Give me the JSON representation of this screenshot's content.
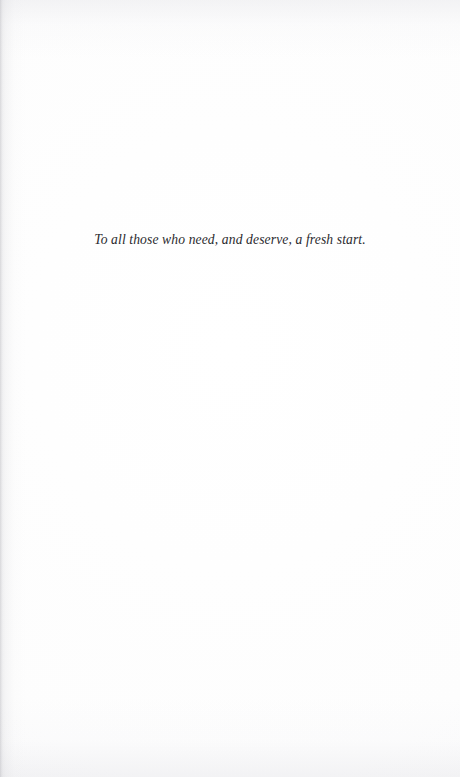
{
  "page": {
    "kind": "book-dedication-page",
    "background_color": "#fefefe",
    "ink_color": "#2a2a2e"
  },
  "dedication": {
    "text": "To all those who need, and deserve, a fresh start."
  }
}
